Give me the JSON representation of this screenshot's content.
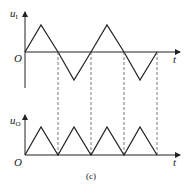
{
  "figure": {
    "caption": "(c)",
    "top_plot": {
      "y_label": "u",
      "y_label_sub": "I",
      "x_label": "t",
      "origin_label": "O",
      "waveform": "triangle (bipolar)"
    },
    "bottom_plot": {
      "y_label": "u",
      "y_label_sub": "O",
      "x_label": "t",
      "origin_label": "O",
      "waveform": "full-wave rectified triangle"
    },
    "colors": {
      "line": "#222222",
      "dashed": "#555555",
      "background": "#ffffff"
    }
  }
}
